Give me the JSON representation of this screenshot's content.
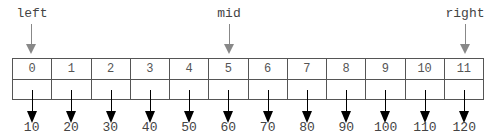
{
  "pointers": [
    {
      "label": "left",
      "index": 0
    },
    {
      "label": "mid",
      "index": 5
    },
    {
      "label": "right",
      "index": 11
    }
  ],
  "array": {
    "indices": [
      "0",
      "1",
      "2",
      "3",
      "4",
      "5",
      "6",
      "7",
      "8",
      "9",
      "10",
      "11"
    ],
    "values": [
      "10",
      "20",
      "30",
      "40",
      "50",
      "60",
      "70",
      "80",
      "90",
      "100",
      "110",
      "120"
    ]
  },
  "colors": {
    "pointer_arrow": "#888888",
    "value_arrow": "#000000",
    "border": "#555555"
  }
}
